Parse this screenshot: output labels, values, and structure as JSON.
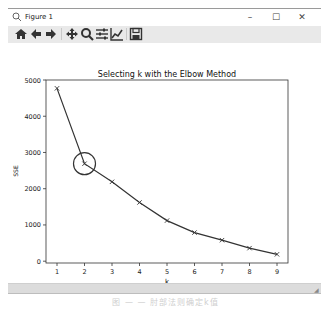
{
  "window": {
    "title": "Figure 1",
    "app_icon": "matplotlib-figure-icon",
    "controls": {
      "minimize": "–",
      "maximize": "☐",
      "close": "✕"
    }
  },
  "toolbar": {
    "buttons": [
      {
        "name": "home",
        "icon": "home-icon",
        "tooltip": "Reset original view"
      },
      {
        "name": "back",
        "icon": "arrow-left-icon",
        "tooltip": "Back to previous view"
      },
      {
        "name": "forward",
        "icon": "arrow-right-icon",
        "tooltip": "Forward to next view"
      },
      {
        "name": "pan",
        "icon": "move-icon",
        "tooltip": "Pan axes"
      },
      {
        "name": "zoom",
        "icon": "magnifier-icon",
        "tooltip": "Zoom to rectangle"
      },
      {
        "name": "subplots",
        "icon": "sliders-icon",
        "tooltip": "Configure subplots"
      },
      {
        "name": "edit",
        "icon": "line-chart-icon",
        "tooltip": "Edit axis, curve and image parameters"
      },
      {
        "name": "save",
        "icon": "floppy-disk-icon",
        "tooltip": "Save the figure"
      }
    ]
  },
  "chart_data": {
    "type": "line",
    "title": "Selecting k with the Elbow Method",
    "xlabel": "k",
    "ylabel": "SSE",
    "x": [
      1,
      2,
      3,
      4,
      5,
      6,
      7,
      8,
      9
    ],
    "series": [
      {
        "name": "SSE",
        "values": [
          4770,
          2690,
          2190,
          1620,
          1120,
          790,
          580,
          360,
          190
        ],
        "marker": "x",
        "color": "#333333"
      }
    ],
    "xticks": [
      "1",
      "2",
      "3",
      "4",
      "5",
      "6",
      "7",
      "8",
      "9"
    ],
    "yticks": [
      "0",
      "1000",
      "2000",
      "3000",
      "4000",
      "5000"
    ],
    "xlim": [
      0.6,
      9.4
    ],
    "ylim": [
      -50,
      5000
    ],
    "grid": false,
    "annotations": [
      {
        "type": "circle",
        "x": 2,
        "y": 2690,
        "label": "elbow point"
      }
    ]
  },
  "caption": "图 — — 肘部法则确定k值"
}
